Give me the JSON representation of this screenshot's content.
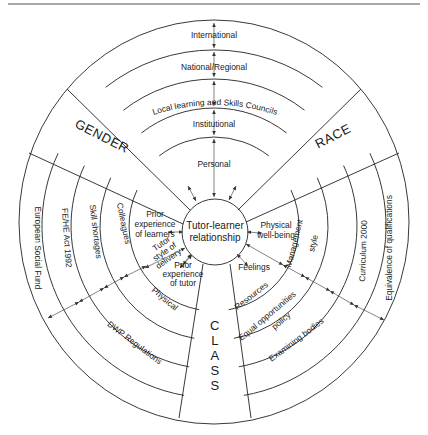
{
  "diagram": {
    "center": {
      "line1": "Tutor-learner",
      "line2": "relationship"
    },
    "top_rings": [
      "International",
      "National/Regional",
      "Local learning and Skills Councils",
      "Institutional",
      "Personal"
    ],
    "sectors": {
      "gender": "GENDER",
      "race": "RACE",
      "class": "CLASS"
    },
    "left_rings": [
      "European Social Fund",
      "FE/HE Act 1992",
      "Skill shortages",
      "Colleagues"
    ],
    "left_inner": {
      "prior_learners": [
        "Prior",
        "experience",
        "of learners"
      ],
      "tutor_style": [
        "Tutor",
        "style of",
        "delivery"
      ],
      "prior_tutor": [
        "Prior",
        "experience",
        "of tutor"
      ]
    },
    "bottom_left_rings": [
      "Physical",
      "DWP Regulations"
    ],
    "right_rings": [
      "Equivalence of qualifications",
      "Curriculum 2000",
      "Management style"
    ],
    "right_inner": {
      "physical_wellbeing": [
        "Physical",
        "well-being"
      ],
      "feelings": "Feelings"
    },
    "bottom_right_rings": [
      "Resources",
      "Equal opportunities policy",
      "Examining bodies"
    ],
    "management_style": [
      "Management",
      "style"
    ],
    "equal_opps": [
      "Equal opportunities",
      "policy"
    ]
  }
}
